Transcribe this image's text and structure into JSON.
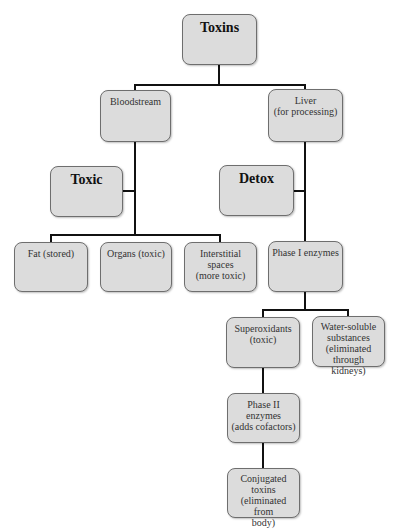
{
  "diagram": {
    "title": "Toxins",
    "nodes": {
      "toxins": {
        "label": "Toxins"
      },
      "bloodstream": {
        "label": "Bloodstream"
      },
      "liver": {
        "label": "Liver\n(for processing)",
        "lines": [
          "Liver",
          "(for processing)"
        ]
      },
      "toxic": {
        "label": "Toxic"
      },
      "detox": {
        "label": "Detox"
      },
      "fat": {
        "label": "Fat (stored)"
      },
      "organs": {
        "label": "Organs (toxic)"
      },
      "interstitial": {
        "lines": [
          "Interstitial spaces",
          "(more toxic)"
        ]
      },
      "phase1": {
        "label": "Phase I enzymes"
      },
      "superoxidants": {
        "lines": [
          "Superoxidants",
          "(toxic)"
        ]
      },
      "water_soluble": {
        "lines": [
          "Water-soluble",
          "substances",
          "(eliminated",
          "through kidneys)"
        ]
      },
      "phase2": {
        "lines": [
          "Phase II",
          "enzymes",
          "(adds cofactors)"
        ]
      },
      "conjugated": {
        "lines": [
          "Conjugated",
          "toxins",
          "(eliminated from",
          "body)"
        ]
      }
    },
    "edges": [
      [
        "toxins",
        "bloodstream"
      ],
      [
        "toxins",
        "liver"
      ],
      [
        "bloodstream",
        "toxic"
      ],
      [
        "bloodstream",
        "fat"
      ],
      [
        "bloodstream",
        "organs"
      ],
      [
        "bloodstream",
        "interstitial"
      ],
      [
        "liver",
        "detox"
      ],
      [
        "liver",
        "phase1"
      ],
      [
        "phase1",
        "superoxidants"
      ],
      [
        "phase1",
        "water_soluble"
      ],
      [
        "superoxidants",
        "phase2"
      ],
      [
        "phase2",
        "conjugated"
      ]
    ],
    "colors": {
      "box_fill": "#dcdcdc",
      "box_border": "#6e6e6e",
      "line": "#111111"
    }
  }
}
